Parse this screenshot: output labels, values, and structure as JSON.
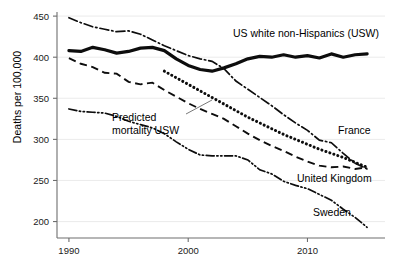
{
  "chart_data": {
    "type": "line",
    "title": "",
    "xlabel": "",
    "ylabel": "Deaths per 100,000",
    "xlim": [
      1989,
      2016.5
    ],
    "ylim": [
      180,
      455
    ],
    "grid": true,
    "legend_position": "inline-labels",
    "xticks": [
      1990,
      2000,
      2010
    ],
    "xticklabels": [
      "1990",
      "2000",
      "2010"
    ],
    "yticks": [
      200,
      250,
      300,
      350,
      400,
      450
    ],
    "yticklabels": [
      "200",
      "250",
      "300",
      "350",
      "400",
      "450"
    ],
    "annotations": [
      {
        "text_line1": "Predicted",
        "text_line2": "mortality USW",
        "x": 2000.5,
        "y": 322
      }
    ],
    "series": [
      {
        "name": "US white non-Hispanics (USW)",
        "label": "US white non-Hispanics (USW)",
        "style": "solid-thick",
        "x": [
          1990,
          1991,
          1992,
          1993,
          1994,
          1995,
          1996,
          1997,
          1998,
          1999,
          2000,
          2001,
          2002,
          2003,
          2004,
          2005,
          2006,
          2007,
          2008,
          2009,
          2010,
          2011,
          2012,
          2013,
          2014,
          2015
        ],
        "values": [
          408,
          407,
          412,
          409,
          405,
          407,
          411,
          412,
          408,
          398,
          390,
          385,
          383,
          387,
          392,
          398,
          401,
          400,
          403,
          400,
          402,
          399,
          404,
          400,
          403,
          404
        ]
      },
      {
        "name": "Predicted mortality USW",
        "label": "Predicted mortality USW",
        "style": "dotted",
        "x": [
          1998,
          1999,
          2000,
          2001,
          2002,
          2003,
          2004,
          2005,
          2006,
          2007,
          2008,
          2009,
          2010,
          2011,
          2012,
          2013,
          2014,
          2015
        ],
        "values": [
          383,
          375,
          367,
          359,
          351,
          343,
          335,
          327,
          320,
          313,
          306,
          300,
          294,
          288,
          283,
          278,
          272,
          266
        ]
      },
      {
        "name": "France",
        "label": "France",
        "style": "dash-dot",
        "x": [
          1990,
          1991,
          1992,
          1993,
          1994,
          1995,
          1996,
          1997,
          1998,
          1999,
          2000,
          2001,
          2002,
          2003,
          2004,
          2005,
          2006,
          2007,
          2008,
          2009,
          2010,
          2011,
          2012,
          2013,
          2014,
          2015
        ],
        "values": [
          448,
          442,
          437,
          434,
          431,
          432,
          428,
          421,
          414,
          408,
          402,
          398,
          395,
          386,
          371,
          361,
          351,
          341,
          330,
          320,
          311,
          299,
          296,
          283,
          271,
          264
        ]
      },
      {
        "name": "United Kingdom",
        "label": "United Kingdom",
        "style": "dashed",
        "x": [
          1990,
          1991,
          1992,
          1993,
          1994,
          1995,
          1996,
          1997,
          1998,
          1999,
          2000,
          2001,
          2002,
          2003,
          2004,
          2005,
          2006,
          2007,
          2008,
          2009,
          2010,
          2011,
          2012,
          2013,
          2014,
          2015
        ],
        "values": [
          399,
          392,
          388,
          381,
          380,
          370,
          367,
          369,
          360,
          352,
          344,
          337,
          331,
          325,
          316,
          307,
          299,
          292,
          286,
          279,
          273,
          268,
          266,
          267,
          264,
          266
        ]
      },
      {
        "name": "Sweden",
        "label": "Sweden",
        "style": "dash-dot-dot",
        "x": [
          1990,
          1991,
          1992,
          1993,
          1994,
          1995,
          1996,
          1997,
          1998,
          1999,
          2000,
          2001,
          2002,
          2003,
          2004,
          2005,
          2006,
          2007,
          2008,
          2009,
          2010,
          2011,
          2012,
          2013,
          2014,
          2015
        ],
        "values": [
          337,
          334,
          333,
          332,
          328,
          322,
          318,
          314,
          307,
          297,
          288,
          281,
          280,
          280,
          280,
          275,
          263,
          258,
          249,
          244,
          240,
          233,
          226,
          215,
          205,
          193
        ]
      }
    ]
  },
  "labels": {
    "usw": "US white non-Hispanics (USW)",
    "france": "France",
    "uk": "United Kingdom",
    "sweden": "Sweden",
    "predicted_line1": "Predicted",
    "predicted_line2": "mortality USW",
    "ylabel": "Deaths per 100,000"
  },
  "colors": {
    "line": "#0d0d0d",
    "axis": "#6e6e6e",
    "grid": "#e9e9e9",
    "background": "#ffffff"
  }
}
